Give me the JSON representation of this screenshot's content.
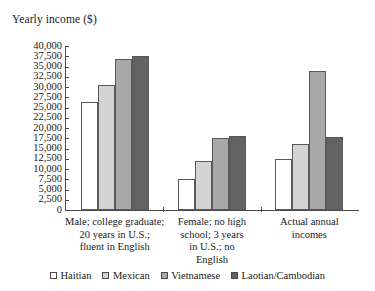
{
  "chart_data": {
    "type": "bar",
    "title": "Yearly income ($)",
    "xlabel": "",
    "ylabel": "Yearly income ($)",
    "ylim": [
      0,
      40000
    ],
    "ytick_step": 2500,
    "yticks": [
      "40,000",
      "37,500",
      "35,000",
      "32,500",
      "30,000",
      "27,500",
      "25,000",
      "22,500",
      "20,000",
      "17,500",
      "15,000",
      "12,500",
      "10,000",
      "7,500",
      "5,000",
      "2,500",
      "0"
    ],
    "grid": false,
    "legend_position": "bottom",
    "categories": [
      "Male; college graduate;\n20 years in U.S.;\nfluent in English",
      "Female; no high\nschool; 3 years\nin U.S.; no\nEnglish",
      "Actual annual\nincomes"
    ],
    "category_lines": [
      [
        "Male; college graduate;",
        "20 years in U.S.;",
        "fluent in English"
      ],
      [
        "Female; no high",
        "school; 3 years",
        "in U.S.; no",
        "English"
      ],
      [
        "Actual annual",
        "incomes"
      ]
    ],
    "series": [
      {
        "name": "Haitian",
        "color": "#ffffff",
        "values": [
          26300,
          7500,
          12500
        ]
      },
      {
        "name": "Mexican",
        "color": "#d4d4d4",
        "values": [
          30500,
          12000,
          16200
        ]
      },
      {
        "name": "Vietnamese",
        "color": "#a8a8a8",
        "values": [
          36800,
          17500,
          34000
        ]
      },
      {
        "name": "Laotian/Cambodian",
        "color": "#636363",
        "values": [
          37500,
          18100,
          17800
        ]
      }
    ]
  }
}
